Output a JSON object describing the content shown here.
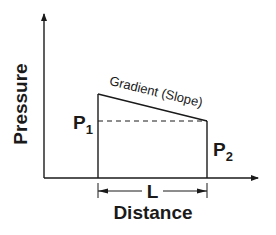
{
  "diagram": {
    "y_axis_label": "Pressure",
    "x_axis_label": "Distance",
    "gradient_label": "Gradient (Slope)",
    "p1": {
      "base": "P",
      "sub": "1"
    },
    "p2": {
      "base": "P",
      "sub": "2"
    },
    "length_label": "L",
    "colors": {
      "line": "#1a1a1a",
      "background": "#ffffff"
    }
  }
}
